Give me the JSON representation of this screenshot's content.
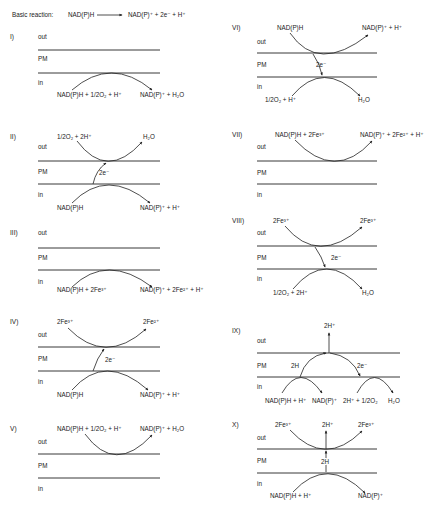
{
  "figure": {
    "basic_reaction": {
      "label": "Basic reaction:",
      "reactant": "NAD(P)H",
      "product": "NAD(P)⁺ + 2e⁻ + H⁺"
    },
    "compartments": {
      "out": "out",
      "pm": "PM",
      "in": "in"
    },
    "panels": {
      "p1": {
        "id": "I)",
        "in_left": "NAD(P)H + 1/2O₂ + H⁺",
        "in_right": "NAD(P)⁺ + H₂O"
      },
      "p2": {
        "id": "II)",
        "out_left": "1/2O₂ + 2H⁺",
        "out_right": "H₂O",
        "transfer": "2e⁻",
        "in_left": "NAD(P)H",
        "in_right": "NAD(P)⁺ + H⁺"
      },
      "p3": {
        "id": "III)",
        "in_left": "NAD(P)H + 2Fe³⁺",
        "in_right": "NAD(P)⁺ + 2Fe²⁺ + H⁺"
      },
      "p4": {
        "id": "IV)",
        "out_left": "2Fe³⁺",
        "out_right": "2Fe²⁺",
        "transfer": "2e⁻",
        "in_left": "NAD(P)H",
        "in_right": "NAD(P)⁺ + H⁺"
      },
      "p5": {
        "id": "V)",
        "out_left": "NAD(P)H + 1/2O₂ + H⁺",
        "out_right": "NAD(P)⁺ + H₂O"
      },
      "p6": {
        "id": "VI)",
        "out_left": "NAD(P)H",
        "out_right": "NAD(P)⁺ + H⁺",
        "transfer": "2e⁻",
        "in_left": "1/2O₂ + H⁺",
        "in_right": "H₂O"
      },
      "p7": {
        "id": "VII)",
        "out_left": "NAD(P)H + 2Fe³⁺",
        "out_right": "NAD(P)⁺ + 2Fe²⁺ + H⁺"
      },
      "p8": {
        "id": "VIII)",
        "out_left": "2Fe³⁺",
        "out_right": "2Fe³⁺",
        "transfer": "2e⁻",
        "in_left": "1/2O₂ + 2H⁺",
        "in_right": "H₂O"
      },
      "p9": {
        "id": "IX)",
        "out_center": "2H⁺",
        "transfer_left": "2H",
        "transfer_right": "2e⁻",
        "in_1": "NAD(P)H + H⁺",
        "in_2": "NAD(P)⁺",
        "in_3": "2H⁺ + 1/2O₂",
        "in_4": "H₂O"
      },
      "p10": {
        "id": "X)",
        "out_left": "2Fe³⁺",
        "out_center": "2H⁺",
        "out_right": "2Fe³⁺",
        "transfer": "2H",
        "in_left": "NAD(P)H + H⁺",
        "in_right": "NAD(P)⁺"
      }
    }
  }
}
